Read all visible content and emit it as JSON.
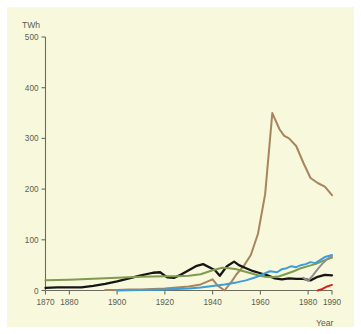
{
  "figure": {
    "background_color": "#ffffff",
    "plot_background_color": "#f8f8dc",
    "axis_color": "#6b6b5e",
    "text_color": "#5d5d52"
  },
  "axes": {
    "y_axis_title": "TWh",
    "x_axis_title": "Year",
    "y_ticks": [
      "0",
      "100",
      "200",
      "300",
      "400",
      "500"
    ],
    "x_ticks": [
      "1870",
      "1880",
      "1900",
      "1920",
      "1940",
      "1960",
      "1980",
      "1990"
    ]
  },
  "chart_data": {
    "type": "line",
    "title": "",
    "subtitle": "",
    "xlabel": "Year",
    "ylabel": "TWh",
    "xlim": [
      1870,
      1990
    ],
    "ylim": [
      0,
      500
    ],
    "grid": false,
    "legend_position": "none",
    "y_tick_values": [
      0,
      100,
      200,
      300,
      400,
      500
    ],
    "x_tick_values": [
      1870,
      1880,
      1900,
      1920,
      1940,
      1960,
      1980,
      1990
    ],
    "series": [
      {
        "name": "brown-series",
        "color": "#a8855c",
        "x": [
          1895,
          1900,
          1905,
          1910,
          1915,
          1920,
          1925,
          1930,
          1935,
          1940,
          1942,
          1945,
          1948,
          1950,
          1953,
          1956,
          1959,
          1962,
          1965,
          1968,
          1970,
          1972,
          1975,
          1978,
          1981,
          1984,
          1987,
          1990
        ],
        "y": [
          1,
          1,
          2,
          2,
          3,
          4,
          6,
          8,
          12,
          22,
          10,
          0,
          18,
          32,
          48,
          70,
          112,
          190,
          350,
          318,
          305,
          300,
          285,
          252,
          222,
          212,
          205,
          188
        ]
      },
      {
        "name": "black-series",
        "color": "#161616",
        "x": [
          1870,
          1875,
          1880,
          1885,
          1890,
          1895,
          1900,
          1905,
          1910,
          1915,
          1918,
          1921,
          1924,
          1927,
          1930,
          1933,
          1936,
          1939,
          1941,
          1943,
          1946,
          1949,
          1951,
          1954,
          1957,
          1960,
          1963,
          1966,
          1969,
          1972,
          1975,
          1978,
          1981,
          1984,
          1987,
          1990
        ],
        "y": [
          5,
          6,
          6,
          6,
          9,
          13,
          18,
          24,
          30,
          35,
          36,
          26,
          25,
          32,
          40,
          48,
          52,
          45,
          40,
          29,
          48,
          57,
          50,
          44,
          38,
          34,
          30,
          24,
          22,
          24,
          23,
          23,
          20,
          27,
          31,
          30
        ]
      },
      {
        "name": "green-series",
        "color": "#7f9b4e",
        "x": [
          1870,
          1880,
          1890,
          1900,
          1910,
          1920,
          1925,
          1930,
          1935,
          1940,
          1944,
          1947,
          1950,
          1953,
          1956,
          1959,
          1962,
          1965,
          1968,
          1971,
          1974,
          1977,
          1980,
          1983,
          1986,
          1990
        ],
        "y": [
          20,
          21,
          23,
          25,
          27,
          28,
          28,
          29,
          32,
          40,
          45,
          44,
          42,
          38,
          34,
          30,
          27,
          26,
          28,
          33,
          38,
          44,
          48,
          52,
          58,
          65
        ]
      },
      {
        "name": "blue-series",
        "color": "#3d9ddb",
        "x": [
          1900,
          1910,
          1920,
          1930,
          1935,
          1940,
          1945,
          1950,
          1954,
          1958,
          1961,
          1964,
          1967,
          1969,
          1971,
          1973,
          1975,
          1977,
          1979,
          1981,
          1983,
          1985,
          1987,
          1990
        ],
        "y": [
          0,
          1,
          2,
          4,
          6,
          9,
          12,
          16,
          20,
          26,
          32,
          38,
          36,
          42,
          44,
          48,
          46,
          50,
          52,
          56,
          54,
          60,
          66,
          70
        ]
      },
      {
        "name": "gray-series",
        "color": "#8e8e8e",
        "x": [
          1978,
          1980,
          1982,
          1984,
          1986,
          1988,
          1990
        ],
        "y": [
          25,
          19,
          30,
          42,
          53,
          62,
          68
        ]
      },
      {
        "name": "red-series",
        "color": "#d62516",
        "x": [
          1984,
          1986,
          1988,
          1990
        ],
        "y": [
          0,
          3,
          8,
          11
        ]
      }
    ]
  }
}
